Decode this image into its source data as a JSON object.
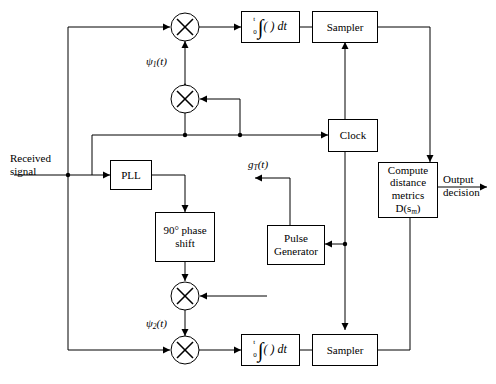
{
  "diagram": {
    "input_label": "Received\nsignal",
    "input_label_line1": "Received",
    "input_label_line2": "signal",
    "output_label_line1": "Output",
    "output_label_line2": "decision",
    "blocks": {
      "integrator_top": "∫₀ᵗ ( ) dt",
      "integrator_bottom": "∫₀ᵗ ( ) dt",
      "sampler_top": "Sampler",
      "sampler_bottom": "Sampler",
      "clock": "Clock",
      "pll": "PLL",
      "phase_shift_line1": "90° phase",
      "phase_shift_line2": "shift",
      "pulse_generator_line1": "Pulse",
      "pulse_generator_line2": "Generator",
      "metrics_line1": "Compute",
      "metrics_line2": "distance",
      "metrics_line3": "metrics D(s",
      "metrics_sub": "m",
      "metrics_line3_end": ")"
    },
    "signal_labels": {
      "psi1": "ψ",
      "psi1_sub": "1",
      "psi1_arg": "(t)",
      "psi2": "ψ",
      "psi2_sub": "2",
      "psi2_arg": "(t)",
      "gT": "g",
      "gT_sub": "T",
      "gT_arg": "(t)"
    },
    "multipliers": [
      "multiplier-top",
      "multiplier-upper-mid",
      "multiplier-lower-mid",
      "multiplier-bottom"
    ],
    "colors": {
      "line": "#000000",
      "background": "#ffffff",
      "text": "#000000"
    }
  }
}
